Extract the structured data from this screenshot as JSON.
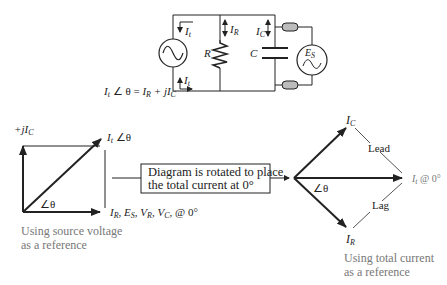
{
  "circuit": {
    "source_left_icon": "ac-source",
    "source_right_label": "E",
    "source_right_sub": "S",
    "resistor_label": "R",
    "capacitor_label": "C",
    "current_top_left": "I",
    "current_top_left_sub": "t",
    "current_bottom_left": "I",
    "current_bottom_left_sub": "t",
    "current_resistor": "I",
    "current_resistor_sub": "R",
    "current_capacitor": "I",
    "current_capacitor_sub": "C",
    "equation": {
      "lhs": "I",
      "lhs_sub": "t",
      "angle": " ∠ θ = ",
      "r1": "I",
      "r1_sub": "R",
      "plus": " + j",
      "r2": "I",
      "r2_sub": "C"
    }
  },
  "left_phasor": {
    "y_axis_label_prefix": "+j",
    "y_axis_label": "I",
    "y_axis_label_sub": "C",
    "diag_label": "I",
    "diag_label_sub": "t",
    "diag_angle": " ∠θ",
    "angle_label": "∠θ",
    "x_axis_label": "I",
    "x_axis_label_sub": "R",
    "x_axis_rest_1": ", E",
    "x_axis_rest_1_sub": "S",
    "x_axis_rest_2": ", V",
    "x_axis_rest_2_sub": "R",
    "x_axis_rest_3": ", V",
    "x_axis_rest_3_sub": "C",
    "x_axis_rest_4": ", @ 0°",
    "caption_line1": "Using source voltage",
    "caption_line2": "as a reference"
  },
  "middle_box": {
    "line1": "Diagram is rotated to place",
    "line2": "the total current at 0°"
  },
  "right_phasor": {
    "top_label": "I",
    "top_label_sub": "C",
    "bottom_label": "I",
    "bottom_label_sub": "R",
    "right_label": "I",
    "right_label_sub": "t",
    "right_label_rest": " @ 0°",
    "lead_label": "Lead",
    "lag_label": "Lag",
    "angle_label": "∠θ",
    "caption_line1": "Using total current",
    "caption_line2": "as a reference"
  },
  "colors": {
    "line": "#222222",
    "caption": "#777777",
    "coax_fill": "#bbbbbb"
  }
}
